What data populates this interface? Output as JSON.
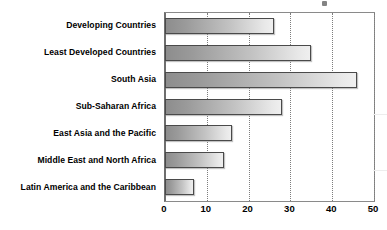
{
  "chart_data": {
    "type": "bar",
    "orientation": "horizontal",
    "title": "",
    "subtitle": "",
    "xlabel": "",
    "ylabel": "",
    "xlim": [
      0,
      50
    ],
    "ylim": null,
    "grid": true,
    "grid_axis": "x",
    "legend": false,
    "legend_position": "none",
    "categories": [
      "Developing Countries",
      "Least Developed Countries",
      "South Asia",
      "Sub-Saharan Africa",
      "East Asia and the Pacific",
      "Middle East and North Africa",
      "Latin America and the Caribbean"
    ],
    "values": [
      26,
      35,
      46,
      28,
      16,
      14,
      7
    ],
    "xticks": [
      0,
      10,
      20,
      30,
      40,
      50
    ],
    "xtick_labels": [
      "0",
      "10",
      "20",
      "30",
      "40",
      "50"
    ],
    "bar_style": {
      "fill": "horizontal-gradient-gray",
      "gradient_start": "#8d8d8d",
      "gradient_end": "#efefef",
      "border": "#4a4a4a"
    }
  },
  "axis": {
    "gridline_color": "#7d7d7d",
    "frame_color": "#8a8a8a"
  },
  "caption": {
    "text": ""
  }
}
